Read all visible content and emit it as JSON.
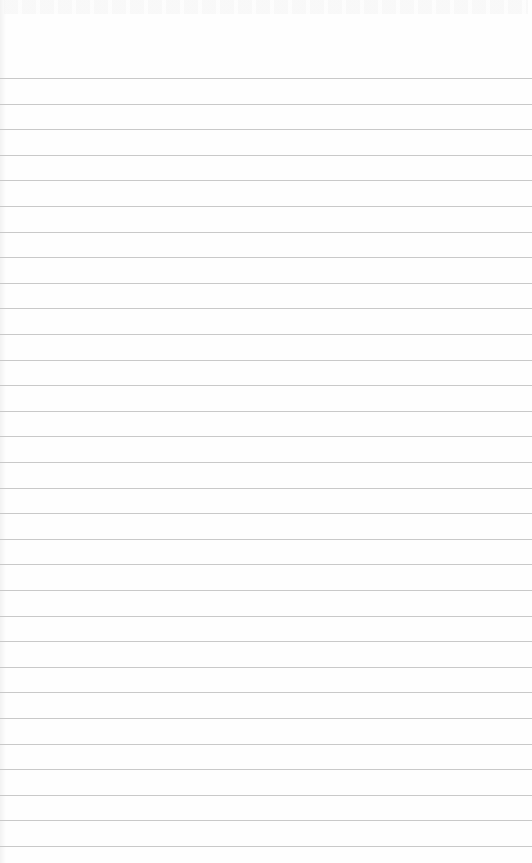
{
  "page": {
    "type": "ruled-notebook-paper",
    "background_color": "#fefefe",
    "rule_color": "#c9c9c9",
    "header_text": "",
    "rules": {
      "count": 31,
      "first_y": 78,
      "last_y": 846,
      "spacing": 25.6
    },
    "lines_text": []
  }
}
